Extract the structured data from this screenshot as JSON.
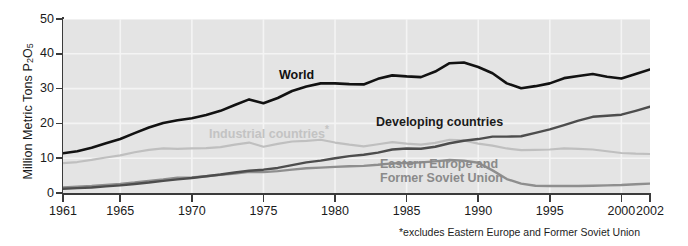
{
  "chart_data": {
    "type": "line",
    "title": "",
    "xlabel": "",
    "ylabel": "Million Metric Tons P2O5",
    "ylabel_html": "Million Metric Tons P<sub>2</sub>O<sub>5</sub>",
    "xlim": [
      1961,
      2002
    ],
    "ylim": [
      0,
      50
    ],
    "yticks": [
      0,
      10,
      20,
      30,
      40,
      50
    ],
    "xticks": [
      1961,
      1965,
      1970,
      1975,
      1980,
      1985,
      1990,
      1995,
      2000,
      2002
    ],
    "xtick_labels": [
      "1961",
      "1965",
      "1970",
      "1975",
      "1980",
      "1985",
      "1990",
      "1995",
      "2000",
      "2002"
    ],
    "ytick_labels": [
      "0",
      "10",
      "20",
      "30",
      "40",
      "50"
    ],
    "grid": "horizontal and vertical white gridlines on light gray panel",
    "legend_position": "inline labels on plot",
    "plot_background": "#e4e4e4",
    "gridline_color": "#f4f4f4",
    "x": [
      1961,
      1962,
      1963,
      1964,
      1965,
      1966,
      1967,
      1968,
      1969,
      1970,
      1971,
      1972,
      1973,
      1974,
      1975,
      1976,
      1977,
      1978,
      1979,
      1980,
      1981,
      1982,
      1983,
      1984,
      1985,
      1986,
      1987,
      1988,
      1989,
      1990,
      1991,
      1992,
      1993,
      1994,
      1995,
      1996,
      1997,
      1998,
      1999,
      2000,
      2001,
      2002
    ],
    "series": [
      {
        "name": "World",
        "color": "#121212",
        "linewidth": 2.6,
        "values": [
          11.4,
          12.0,
          13.0,
          14.3,
          15.5,
          17.2,
          18.8,
          20.1,
          20.9,
          21.5,
          22.4,
          23.6,
          25.3,
          26.9,
          25.8,
          27.3,
          29.3,
          30.6,
          31.5,
          31.5,
          31.3,
          31.2,
          32.8,
          33.8,
          33.5,
          33.3,
          34.9,
          37.3,
          37.5,
          36.2,
          34.4,
          31.5,
          30.1,
          30.7,
          31.5,
          33.0,
          33.6,
          34.2,
          33.4,
          32.9,
          34.2,
          35.5
        ]
      },
      {
        "name": "Industrial countries*",
        "label_lines": [
          "Industrial countries*"
        ],
        "color": "#bfbfbf",
        "linewidth": 2.2,
        "values": [
          8.6,
          8.9,
          9.5,
          10.2,
          10.8,
          11.7,
          12.4,
          12.8,
          12.7,
          12.8,
          12.9,
          13.2,
          13.9,
          14.5,
          13.3,
          14.1,
          14.8,
          15.0,
          15.3,
          14.5,
          13.9,
          13.4,
          14.0,
          14.6,
          14.2,
          13.9,
          14.4,
          15.3,
          15.1,
          14.2,
          13.6,
          12.8,
          12.3,
          12.4,
          12.5,
          12.8,
          12.7,
          12.5,
          12.0,
          11.5,
          11.3,
          11.2
        ]
      },
      {
        "name": "Developing countries",
        "color": "#4d4d4d",
        "linewidth": 2.4,
        "values": [
          1.2,
          1.4,
          1.6,
          1.9,
          2.2,
          2.6,
          3.0,
          3.5,
          3.9,
          4.3,
          4.8,
          5.3,
          5.9,
          6.4,
          6.7,
          7.2,
          8.0,
          8.8,
          9.3,
          10.0,
          10.6,
          11.0,
          11.6,
          12.5,
          12.8,
          12.7,
          13.3,
          14.3,
          15.0,
          15.5,
          16.2,
          16.2,
          16.3,
          17.3,
          18.3,
          19.5,
          20.8,
          21.9,
          22.2,
          22.5,
          23.6,
          24.8
        ]
      },
      {
        "name": "Eastern Europe and Former Soviet Union",
        "label_lines": [
          "Eastern Europe and",
          "Former Soviet Union"
        ],
        "color": "#8e8e8e",
        "linewidth": 2.4,
        "values": [
          1.6,
          1.8,
          2.0,
          2.3,
          2.6,
          3.0,
          3.5,
          3.9,
          4.4,
          4.5,
          4.8,
          5.2,
          5.6,
          6.1,
          6.0,
          6.3,
          6.7,
          7.1,
          7.3,
          7.5,
          7.7,
          7.8,
          8.1,
          8.5,
          8.6,
          8.8,
          9.1,
          9.5,
          9.3,
          8.7,
          6.5,
          4.0,
          2.7,
          2.1,
          2.0,
          2.0,
          2.0,
          2.1,
          2.2,
          2.3,
          2.5,
          2.7
        ]
      }
    ],
    "annotations": [
      {
        "text": "World",
        "role": "series-label"
      },
      {
        "text": "Industrial countries*",
        "role": "series-label"
      },
      {
        "text": "Developing countries",
        "role": "series-label"
      },
      {
        "text": "Eastern Europe and Former Soviet Union",
        "role": "series-label"
      }
    ],
    "footnote": "*excludes Eastern Europe and Former Soviet Union"
  },
  "labels": {
    "y_axis_title": "Million Metric Tons P",
    "y_axis_sub1": "2",
    "y_axis_mid": "O",
    "y_axis_sub2": "5",
    "world": "World",
    "industrial": "Industrial countries",
    "industrial_asterisk": "*",
    "developing": "Developing countries",
    "eastern_line1": "Eastern Europe and",
    "eastern_line2": "Former Soviet Union",
    "footnote": "*excludes Eastern Europe and Former Soviet Union"
  },
  "yticks": [
    {
      "value": 50,
      "label": "50"
    },
    {
      "value": 40,
      "label": "40"
    },
    {
      "value": 30,
      "label": "30"
    },
    {
      "value": 20,
      "label": "20"
    },
    {
      "value": 10,
      "label": "10"
    },
    {
      "value": 0,
      "label": "0"
    }
  ],
  "xticks": [
    {
      "value": 1961,
      "label": "1961"
    },
    {
      "value": 1965,
      "label": "1965"
    },
    {
      "value": 1970,
      "label": "1970"
    },
    {
      "value": 1975,
      "label": "1975"
    },
    {
      "value": 1980,
      "label": "1980"
    },
    {
      "value": 1985,
      "label": "1985"
    },
    {
      "value": 1990,
      "label": "1990"
    },
    {
      "value": 1995,
      "label": "1995"
    },
    {
      "value": 2000,
      "label": "2000"
    },
    {
      "value": 2002,
      "label": "2002"
    }
  ]
}
